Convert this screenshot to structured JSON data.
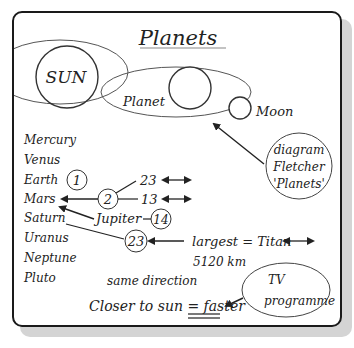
{
  "title": "Planets",
  "orbit_diagram": {
    "sun_label": "SUN",
    "planet_label": "Planet",
    "moon_label": "Moon"
  },
  "planet_list": [
    "Mercury",
    "Venus",
    "Earth",
    "Mars",
    "Saturn",
    "Uranus",
    "Neptune",
    "Pluto"
  ],
  "moon_counts": {
    "earth": "1",
    "mars": "2",
    "jupiter_label": "Jupiter",
    "jupiter": "14",
    "saturn": "23",
    "branch_top": "23",
    "branch_bottom": "13"
  },
  "titan_note": {
    "line1": "largest = Titan",
    "line2": "5120 km"
  },
  "same_direction": "same direction",
  "closer_note": {
    "prefix": "Closer to sun = ",
    "emphasis": "faster"
  },
  "source_bubble": {
    "line1": "diagram",
    "line2": "Fletcher",
    "line3": "'Planets'"
  },
  "tv_bubble": {
    "line1": "TV",
    "line2": "programme"
  },
  "colors": {
    "ink": "#222222",
    "border": "#1a1a1a",
    "shadow": "#d4d4d4",
    "orbit": "#555555"
  }
}
